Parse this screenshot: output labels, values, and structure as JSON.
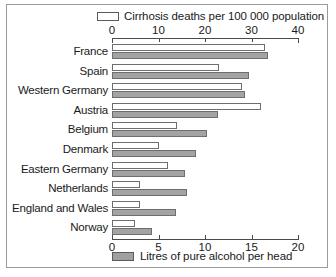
{
  "legend": {
    "top": {
      "swatch": "white-swatch-icon",
      "label": "Cirrhosis deaths per 100 000 population"
    },
    "bottom": {
      "swatch": "grey-swatch-icon",
      "label": "Litres of pure alcohol per head"
    }
  },
  "axes": {
    "top": {
      "ticks": [
        0,
        10,
        20,
        30,
        40
      ],
      "min": 0,
      "max": 40
    },
    "bottom": {
      "ticks": [
        0,
        5,
        10,
        15,
        20
      ],
      "min": 0,
      "max": 20
    }
  },
  "chart_data": {
    "type": "bar",
    "orientation": "horizontal",
    "title": "",
    "categories": [
      "France",
      "Spain",
      "Western Germany",
      "Austria",
      "Belgium",
      "Denmark",
      "Eastern Germany",
      "Netherlands",
      "England and Wales",
      "Norway"
    ],
    "series": [
      {
        "name": "Cirrhosis deaths per 100 000 population",
        "color": "#ffffff",
        "axis": "top",
        "xlabel": "Cirrhosis deaths per 100 000 population",
        "xlim": [
          0,
          40
        ],
        "values": [
          33,
          23,
          28,
          32,
          14,
          10,
          12,
          6,
          6,
          5
        ]
      },
      {
        "name": "Litres of pure alcohol per head",
        "color": "#a3a3a3",
        "axis": "bottom",
        "xlabel": "Litres of pure alcohol per head",
        "xlim": [
          0,
          20
        ],
        "values": [
          16.8,
          14.7,
          14.3,
          11.4,
          10.2,
          9.0,
          7.8,
          8.1,
          6.9,
          4.3
        ]
      }
    ],
    "grid": false,
    "legend_position": "top and bottom"
  }
}
